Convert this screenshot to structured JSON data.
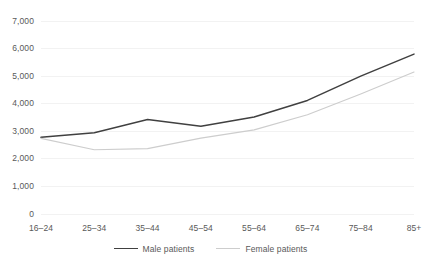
{
  "chart_data": {
    "type": "line",
    "title": "",
    "subtitle": "",
    "xlabel": "",
    "ylabel": "",
    "categories": [
      "16–24",
      "25–34",
      "35–44",
      "45–54",
      "55–64",
      "65–74",
      "75–84",
      "85+"
    ],
    "series": [
      {
        "name": "Male patients",
        "color": "#404040",
        "values": [
          2780,
          2950,
          3430,
          3180,
          3520,
          4120,
          5000,
          5800
        ]
      },
      {
        "name": "Female patients",
        "color": "#cdcdcd",
        "values": [
          2740,
          2330,
          2370,
          2750,
          3050,
          3600,
          4350,
          5150
        ]
      }
    ],
    "ylim": [
      0,
      7000
    ],
    "ytick_values": [
      0,
      1000,
      2000,
      3000,
      4000,
      5000,
      6000,
      7000
    ],
    "ytick_labels": [
      "0",
      "1,000",
      "2,000",
      "3,000",
      "4,000",
      "5,000",
      "6,000",
      "7,000"
    ],
    "grid": true,
    "grid_axis": "y",
    "grid_color": "#f2f2f2",
    "legend_position": "bottom",
    "background_color": "#ffffff",
    "tick_label_color": "#595959"
  },
  "legend": {
    "entries": [
      {
        "label": "Male patients"
      },
      {
        "label": "Female patients"
      }
    ]
  }
}
